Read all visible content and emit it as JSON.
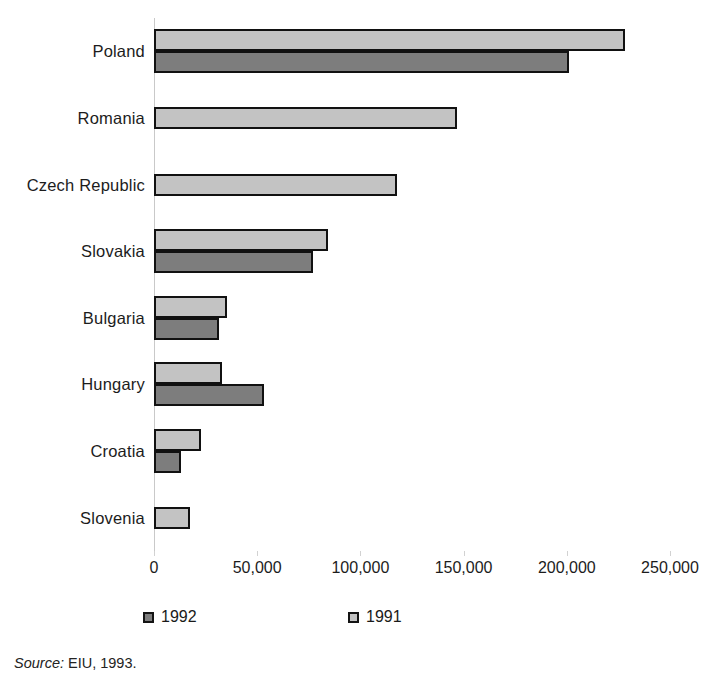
{
  "chart_data": {
    "type": "bar",
    "orientation": "horizontal",
    "title": "",
    "subtitle": "",
    "xlabel": "",
    "ylabel": "",
    "xlim": [
      0,
      250000
    ],
    "xticks": [
      0,
      50000,
      100000,
      150000,
      200000,
      250000
    ],
    "xtick_labels": [
      "0",
      "50,000",
      "100,000",
      "150,000",
      "200,000",
      "250,000"
    ],
    "grid": false,
    "legend_position": "bottom",
    "categories": [
      "Poland",
      "Romania",
      "Czech Republic",
      "Slovakia",
      "Bulgaria",
      "Hungary",
      "Croatia",
      "Slovenia"
    ],
    "series": [
      {
        "name": "1991",
        "color": "#c3c3c3",
        "values": [
          228000,
          147000,
          117500,
          84500,
          35500,
          33000,
          22800,
          17500
        ]
      },
      {
        "name": "1992",
        "color": "#7d7d7d",
        "values": [
          201000,
          null,
          null,
          77000,
          31500,
          53500,
          13000,
          null
        ]
      }
    ]
  },
  "legend": {
    "items": [
      {
        "label": "1992",
        "swatch": "y1992"
      },
      {
        "label": "1991",
        "swatch": "y1991"
      }
    ]
  },
  "source": {
    "label": "Source:",
    "text": " EIU, 1993."
  },
  "colors": {
    "series_1991": "#c3c3c3",
    "series_1992": "#7d7d7d",
    "bar_outline": "#111111",
    "axis": "#c9c9c9",
    "text": "#1c1c1c"
  }
}
